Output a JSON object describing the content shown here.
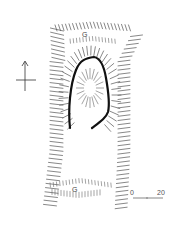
{
  "figure": {
    "type": "earthwork site plan",
    "labels": {
      "top_marker": "G",
      "bottom_marker": "G"
    },
    "north_arrow": {
      "icon": "north-arrow-icon"
    },
    "scale_bar": {
      "start": "0",
      "end": "20"
    },
    "colors": {
      "line": "#111111",
      "hachure": "#555555",
      "background": "#ffffff"
    }
  }
}
